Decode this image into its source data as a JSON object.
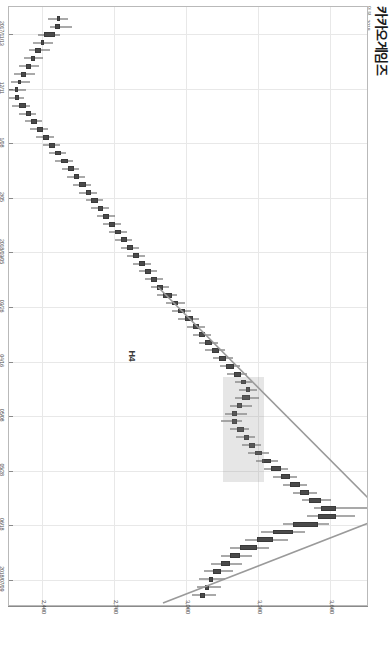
{
  "header": {
    "title": "카카오게임즈",
    "subtitle": "일봉 · 2018"
  },
  "chart_data": {
    "type": "candlestick",
    "title": "카카오게임즈",
    "xlabel": "",
    "ylabel": "",
    "ylim": [
      2250,
      3750
    ],
    "grid": true,
    "y_ticks": [
      "2,400",
      "2,700",
      "3,000",
      "3,300",
      "3,600"
    ],
    "y_tick_values": [
      2400,
      2700,
      3000,
      3300,
      3600
    ],
    "x_ticks": [
      "2017/11/13",
      "12/11",
      "1/08",
      "2/05",
      "2018/03/05",
      "03/26",
      "04/16",
      "05/08",
      "05/28",
      "06/18",
      "2018/07/09"
    ],
    "current_price": {
      "value": "2,112",
      "change": "(-7.83%)",
      "price": 2112
    },
    "annotations": [
      {
        "name": "high-annotation",
        "text": "3,875.04  최고  2018/04/17",
        "price": 3875.04,
        "date": "2018/04/17"
      },
      {
        "name": "low-annotation",
        "text": "2,085.2  최저  2018/02/02",
        "price": 2085.2,
        "date": "2018/02/02"
      }
    ],
    "pattern_label": "H4",
    "candles": [
      {
        "o": 2460,
        "h": 2505,
        "l": 2420,
        "c": 2470
      },
      {
        "o": 2470,
        "h": 2520,
        "l": 2430,
        "c": 2448
      },
      {
        "o": 2448,
        "h": 2470,
        "l": 2380,
        "c": 2405
      },
      {
        "o": 2405,
        "h": 2440,
        "l": 2360,
        "c": 2392
      },
      {
        "o": 2392,
        "h": 2430,
        "l": 2340,
        "c": 2366
      },
      {
        "o": 2366,
        "h": 2400,
        "l": 2320,
        "c": 2352
      },
      {
        "o": 2352,
        "h": 2385,
        "l": 2300,
        "c": 2330
      },
      {
        "o": 2330,
        "h": 2365,
        "l": 2280,
        "c": 2310
      },
      {
        "o": 2310,
        "h": 2345,
        "l": 2265,
        "c": 2296
      },
      {
        "o": 2296,
        "h": 2330,
        "l": 2250,
        "c": 2285
      },
      {
        "o": 2285,
        "h": 2320,
        "l": 2248,
        "c": 2300
      },
      {
        "o": 2300,
        "h": 2345,
        "l": 2270,
        "c": 2328
      },
      {
        "o": 2328,
        "h": 2370,
        "l": 2300,
        "c": 2352
      },
      {
        "o": 2352,
        "h": 2395,
        "l": 2325,
        "c": 2374
      },
      {
        "o": 2374,
        "h": 2420,
        "l": 2346,
        "c": 2400
      },
      {
        "o": 2400,
        "h": 2445,
        "l": 2372,
        "c": 2424
      },
      {
        "o": 2424,
        "h": 2470,
        "l": 2398,
        "c": 2450
      },
      {
        "o": 2450,
        "h": 2495,
        "l": 2424,
        "c": 2476
      },
      {
        "o": 2476,
        "h": 2525,
        "l": 2450,
        "c": 2504
      },
      {
        "o": 2504,
        "h": 2550,
        "l": 2478,
        "c": 2528
      },
      {
        "o": 2528,
        "h": 2575,
        "l": 2500,
        "c": 2550
      },
      {
        "o": 2550,
        "h": 2600,
        "l": 2524,
        "c": 2578
      },
      {
        "o": 2578,
        "h": 2625,
        "l": 2552,
        "c": 2602
      },
      {
        "o": 2602,
        "h": 2650,
        "l": 2578,
        "c": 2628
      },
      {
        "o": 2628,
        "h": 2675,
        "l": 2600,
        "c": 2650
      },
      {
        "o": 2650,
        "h": 2700,
        "l": 2626,
        "c": 2676
      },
      {
        "o": 2676,
        "h": 2725,
        "l": 2650,
        "c": 2700
      },
      {
        "o": 2700,
        "h": 2748,
        "l": 2674,
        "c": 2724
      },
      {
        "o": 2724,
        "h": 2770,
        "l": 2700,
        "c": 2748
      },
      {
        "o": 2748,
        "h": 2800,
        "l": 2724,
        "c": 2776
      },
      {
        "o": 2776,
        "h": 2825,
        "l": 2750,
        "c": 2800
      },
      {
        "o": 2800,
        "h": 2850,
        "l": 2776,
        "c": 2826
      },
      {
        "o": 2826,
        "h": 2875,
        "l": 2800,
        "c": 2850
      },
      {
        "o": 2850,
        "h": 2900,
        "l": 2826,
        "c": 2876
      },
      {
        "o": 2876,
        "h": 2925,
        "l": 2850,
        "c": 2900
      },
      {
        "o": 2900,
        "h": 2960,
        "l": 2876,
        "c": 2938
      },
      {
        "o": 2938,
        "h": 2990,
        "l": 2912,
        "c": 2964
      },
      {
        "o": 2964,
        "h": 3015,
        "l": 2938,
        "c": 2990
      },
      {
        "o": 2990,
        "h": 3050,
        "l": 2964,
        "c": 3024
      },
      {
        "o": 3024,
        "h": 3075,
        "l": 2998,
        "c": 3050
      },
      {
        "o": 3050,
        "h": 3100,
        "l": 3024,
        "c": 3076
      },
      {
        "o": 3076,
        "h": 3130,
        "l": 3050,
        "c": 3104
      },
      {
        "o": 3104,
        "h": 3160,
        "l": 3076,
        "c": 3134
      },
      {
        "o": 3134,
        "h": 3190,
        "l": 3108,
        "c": 3164
      },
      {
        "o": 3164,
        "h": 3220,
        "l": 3138,
        "c": 3194
      },
      {
        "o": 3194,
        "h": 3250,
        "l": 3168,
        "c": 3224
      },
      {
        "o": 3224,
        "h": 3270,
        "l": 3198,
        "c": 3246
      },
      {
        "o": 3246,
        "h": 3290,
        "l": 3216,
        "c": 3262
      },
      {
        "o": 3262,
        "h": 3300,
        "l": 3200,
        "c": 3230
      },
      {
        "o": 3230,
        "h": 3270,
        "l": 3180,
        "c": 3208
      },
      {
        "o": 3208,
        "h": 3250,
        "l": 3160,
        "c": 3186
      },
      {
        "o": 3186,
        "h": 3230,
        "l": 3140,
        "c": 3210
      },
      {
        "o": 3210,
        "h": 3260,
        "l": 3180,
        "c": 3236
      },
      {
        "o": 3236,
        "h": 3285,
        "l": 3206,
        "c": 3260
      },
      {
        "o": 3260,
        "h": 3310,
        "l": 3230,
        "c": 3284
      },
      {
        "o": 3284,
        "h": 3340,
        "l": 3256,
        "c": 3312
      },
      {
        "o": 3312,
        "h": 3380,
        "l": 3286,
        "c": 3350
      },
      {
        "o": 3350,
        "h": 3420,
        "l": 3320,
        "c": 3390
      },
      {
        "o": 3390,
        "h": 3460,
        "l": 3360,
        "c": 3430
      },
      {
        "o": 3430,
        "h": 3500,
        "l": 3400,
        "c": 3470
      },
      {
        "o": 3470,
        "h": 3540,
        "l": 3440,
        "c": 3510
      },
      {
        "o": 3510,
        "h": 3600,
        "l": 3480,
        "c": 3560
      },
      {
        "o": 3560,
        "h": 3875,
        "l": 3530,
        "c": 3620
      },
      {
        "o": 3620,
        "h": 3700,
        "l": 3500,
        "c": 3545
      },
      {
        "o": 3545,
        "h": 3590,
        "l": 3400,
        "c": 3440
      },
      {
        "o": 3440,
        "h": 3490,
        "l": 3310,
        "c": 3360
      },
      {
        "o": 3360,
        "h": 3420,
        "l": 3240,
        "c": 3290
      },
      {
        "o": 3290,
        "h": 3340,
        "l": 3180,
        "c": 3220
      },
      {
        "o": 3220,
        "h": 3270,
        "l": 3140,
        "c": 3180
      },
      {
        "o": 3180,
        "h": 3230,
        "l": 3100,
        "c": 3140
      },
      {
        "o": 3140,
        "h": 3190,
        "l": 3070,
        "c": 3110
      },
      {
        "o": 3110,
        "h": 3160,
        "l": 3050,
        "c": 3090
      },
      {
        "o": 3090,
        "h": 3140,
        "l": 3040,
        "c": 3075
      },
      {
        "o": 3075,
        "h": 3120,
        "l": 3020,
        "c": 3055
      }
    ]
  }
}
